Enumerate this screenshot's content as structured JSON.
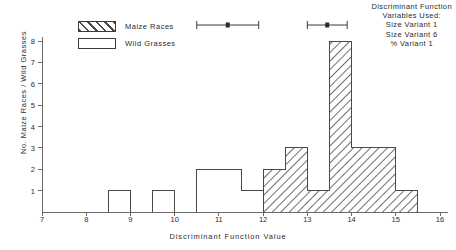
{
  "legend": {
    "items": [
      {
        "label": "Maize Races",
        "fill": "hatch"
      },
      {
        "label": "Wild Grasses",
        "fill": "none"
      }
    ]
  },
  "notes": {
    "lines": [
      "Discriminant Function",
      "Variables Used:",
      "Size Variant 1",
      "Size Variant 6",
      "% Variant 1"
    ]
  },
  "chart_data": {
    "type": "bar",
    "title": "",
    "xlabel": "Discriminant Function Value",
    "ylabel": "No. Maize Races / Wild Grasses",
    "xlim": [
      7,
      16
    ],
    "ylim": [
      0,
      8
    ],
    "bin_width": 0.5,
    "xticks": [
      7,
      8,
      9,
      10,
      11,
      12,
      13,
      14,
      15,
      16
    ],
    "yticks": [
      1,
      2,
      3,
      4,
      5,
      6,
      7,
      8
    ],
    "grid": false,
    "legend_position": "upper-left",
    "series": [
      {
        "name": "Wild Grasses",
        "fill": "none",
        "bins": [
          {
            "x0": 8.5,
            "x1": 9.0,
            "value": 1
          },
          {
            "x0": 9.5,
            "x1": 10.0,
            "value": 1
          },
          {
            "x0": 10.5,
            "x1": 11.0,
            "value": 2
          },
          {
            "x0": 11.0,
            "x1": 11.5,
            "value": 2
          },
          {
            "x0": 11.5,
            "x1": 12.0,
            "value": 1
          },
          {
            "x0": 12.0,
            "x1": 12.5,
            "value": 2
          },
          {
            "x0": 12.5,
            "x1": 13.0,
            "value": 3
          },
          {
            "x0": 13.0,
            "x1": 13.5,
            "value": 1
          }
        ]
      },
      {
        "name": "Maize Races",
        "fill": "hatch",
        "bins": [
          {
            "x0": 12.0,
            "x1": 12.5,
            "value": 2
          },
          {
            "x0": 12.5,
            "x1": 13.0,
            "value": 3
          },
          {
            "x0": 13.0,
            "x1": 13.5,
            "value": 1
          },
          {
            "x0": 13.5,
            "x1": 14.0,
            "value": 8
          },
          {
            "x0": 14.0,
            "x1": 14.5,
            "value": 3
          },
          {
            "x0": 14.5,
            "x1": 15.0,
            "value": 3
          },
          {
            "x0": 15.0,
            "x1": 15.5,
            "value": 1
          }
        ]
      }
    ],
    "annotations": {
      "type": "range-markers",
      "markers": [
        {
          "name": "wild-grasses-range",
          "low": 10.5,
          "center": 11.2,
          "high": 11.9
        },
        {
          "name": "maize-races-range",
          "low": 13.0,
          "center": 13.45,
          "high": 13.9
        }
      ]
    }
  }
}
